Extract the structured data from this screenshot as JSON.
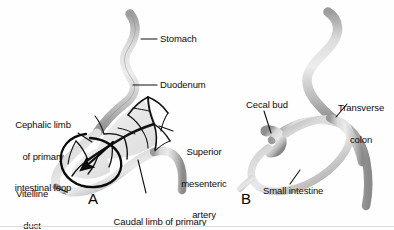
{
  "figure": {
    "background_color": "#fefefe",
    "tissue_fill_light": "#e2e2e2",
    "tissue_fill_mid": "#c4c4c4",
    "tissue_fill_dark": "#8d8d8d",
    "vessel_color": "#1a1a1a",
    "label_color": "#0d0d0d",
    "leader_color": "#111111"
  },
  "panels": [
    {
      "id": "A",
      "letter": "A",
      "letter_x": 88,
      "letter_y": 196,
      "labels": [
        {
          "name": "stomach",
          "text": "Stomach",
          "lines": [
            "Stomach"
          ],
          "x": 160,
          "y": 34,
          "align": "left",
          "leader": {
            "x1": 157,
            "y1": 39,
            "x2": 141,
            "y2": 39
          }
        },
        {
          "name": "duodenum",
          "text": "Duodenum",
          "lines": [
            "Duodenum"
          ],
          "x": 160,
          "y": 80,
          "align": "left",
          "leader": {
            "x1": 157,
            "y1": 85,
            "x2": 133,
            "y2": 85
          }
        },
        {
          "name": "cephalic-limb-of-primary-intestinal-loop",
          "text": "Cephalic limb of primary intestinal loop",
          "lines": [
            "Cephalic limb",
            "of primary",
            "intestinal loop"
          ],
          "x": 6,
          "y": 99,
          "align": "center",
          "leader": {
            "x1": 78,
            "y1": 133,
            "x2": 92,
            "y2": 142
          }
        },
        {
          "name": "superior-mesenteric-artery",
          "text": "Superior mesenteric artery",
          "lines": [
            "Superior",
            "mesenteric",
            "artery"
          ],
          "x": 175,
          "y": 126,
          "align": "center",
          "leader": {
            "x1": 173,
            "y1": 131,
            "x2": 159,
            "y2": 126
          }
        },
        {
          "name": "vitelline-duct",
          "text": "Vitelline duct",
          "lines": [
            "Vitelline",
            "duct"
          ],
          "x": 8,
          "y": 168,
          "align": "center",
          "leader": {
            "x1": 57,
            "y1": 188,
            "x2": 67,
            "y2": 192
          }
        },
        {
          "name": "caudal-limb-of-primary-intestinal-loop",
          "text": "Caudal limb of primary intestinal loop",
          "lines": [
            "Caudal limb of primary",
            "intestinal loop"
          ],
          "x": 104,
          "y": 196,
          "align": "center",
          "leader": {
            "x1": 146,
            "y1": 193,
            "x2": 138,
            "y2": 160
          }
        }
      ],
      "annotations": [
        {
          "name": "rotation-arrow",
          "type": "arrow",
          "description": "curved rotation arrow around superior mesenteric artery axis"
        }
      ]
    },
    {
      "id": "B",
      "letter": "B",
      "letter_x": 241,
      "letter_y": 196,
      "labels": [
        {
          "name": "transverse-colon",
          "text": "Transverse colon",
          "lines": [
            "Transverse",
            "colon"
          ],
          "x": 330,
          "y": 82,
          "align": "center",
          "leader": {
            "x1": 347,
            "y1": 104,
            "x2": 336,
            "y2": 117
          }
        },
        {
          "name": "cecal-bud",
          "text": "Cecal bud",
          "lines": [
            "Cecal bud"
          ],
          "x": 246,
          "y": 100,
          "align": "left",
          "leader": {
            "x1": 264,
            "y1": 111,
            "x2": 271,
            "y2": 133
          }
        },
        {
          "name": "small-intestine",
          "text": "Small intestine",
          "lines": [
            "Small intestine"
          ],
          "x": 263,
          "y": 186,
          "align": "left",
          "leader": {
            "x1": 290,
            "y1": 184,
            "x2": 300,
            "y2": 170
          }
        }
      ],
      "annotations": []
    }
  ]
}
